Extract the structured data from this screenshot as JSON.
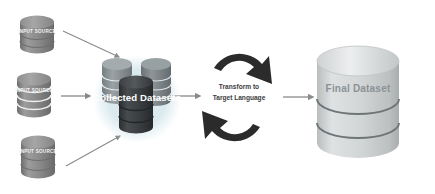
{
  "diagram": {
    "background_color": "#ffffff",
    "inputs": [
      {
        "id": "input-source-top",
        "label": "INPUT SOURCE",
        "body_color": "#8c8c8c",
        "top_color": "#9a9a9a",
        "band_color": "#6f6f6f"
      },
      {
        "id": "input-source-middle",
        "label": "INPUT SOURCE",
        "body_color": "#7f7f7f",
        "top_color": "#8d8d8d",
        "band_color": "#ffffff"
      },
      {
        "id": "input-source-bottom",
        "label": "INPUT SOURCE",
        "body_color": "#8c8c8c",
        "top_color": "#9a9a9a",
        "band_color": "#6f6f6f"
      }
    ],
    "cluster": {
      "label": "Collected Datasets",
      "glow_color": "#cfe3ea",
      "back_left_color": "#8e9699",
      "back_right_color": "#7c8487",
      "front_color": "#3b3f41",
      "front_top_color": "#4a4e50"
    },
    "transform": {
      "line1": "Transform to",
      "line2": "Target Language",
      "arrow_color": "#2b2b2b"
    },
    "output": {
      "label": "Final Dataset",
      "body_color": "#d3d6d7",
      "top_color": "#e2e4e5",
      "band_color": "#6f7477"
    },
    "connectors": {
      "color": "#8a8a8a",
      "items": [
        {
          "id": "arrow-top-input-to-cluster",
          "from": "input-source-top",
          "to": "collected-datasets"
        },
        {
          "id": "arrow-middle-input-to-cluster",
          "from": "input-source-middle",
          "to": "collected-datasets"
        },
        {
          "id": "arrow-bottom-input-to-cluster",
          "from": "input-source-bottom",
          "to": "collected-datasets"
        },
        {
          "id": "arrow-cluster-to-transform",
          "from": "collected-datasets",
          "to": "transform"
        },
        {
          "id": "arrow-transform-to-output",
          "from": "transform",
          "to": "final-dataset"
        }
      ]
    }
  }
}
